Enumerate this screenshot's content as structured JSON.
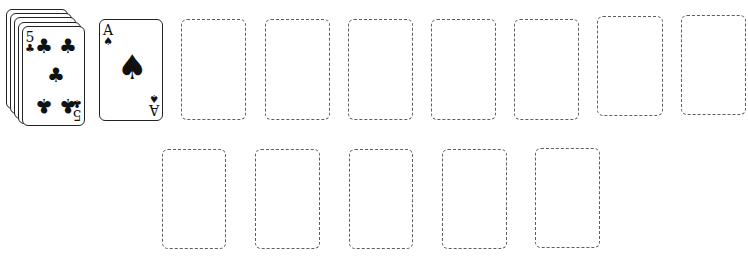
{
  "game": "Solitaire",
  "stock": {
    "stacked_cards": 5,
    "top_card": {
      "rank": "5",
      "suit": "clubs",
      "suit_glyph": "♣",
      "color": "#111111"
    }
  },
  "waste": {
    "top_card": {
      "rank": "A",
      "suit": "spades",
      "suit_glyph": "♠",
      "color": "#111111"
    }
  },
  "top_row_slots": [
    {
      "id": "foundation-1",
      "empty": true
    },
    {
      "id": "foundation-2",
      "empty": true
    },
    {
      "id": "foundation-3",
      "empty": true
    },
    {
      "id": "foundation-4",
      "empty": true
    },
    {
      "id": "foundation-5",
      "empty": true
    },
    {
      "id": "foundation-6",
      "empty": true
    },
    {
      "id": "foundation-7",
      "empty": true
    }
  ],
  "bottom_row_slots": [
    {
      "id": "tableau-1",
      "empty": true
    },
    {
      "id": "tableau-2",
      "empty": true
    },
    {
      "id": "tableau-3",
      "empty": true
    },
    {
      "id": "tableau-4",
      "empty": true
    },
    {
      "id": "tableau-5",
      "empty": true
    }
  ],
  "colors": {
    "card_border": "#222222",
    "slot_dash": "#5e5e5e",
    "background": "#ffffff"
  }
}
